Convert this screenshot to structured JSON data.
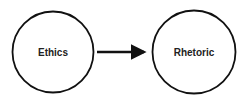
{
  "diagram": {
    "type": "flow",
    "nodes": [
      {
        "id": "ethics",
        "label": "Ethics",
        "shape": "circle"
      },
      {
        "id": "rhetoric",
        "label": "Rhetoric",
        "shape": "circle"
      }
    ],
    "edges": [
      {
        "from": "ethics",
        "to": "rhetoric",
        "style": "arrow"
      }
    ],
    "colors": {
      "stroke": "#111111",
      "text": "#222222",
      "background": "#ffffff"
    }
  }
}
